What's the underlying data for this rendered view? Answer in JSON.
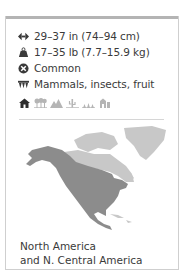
{
  "facts": {
    "length": {
      "icon": "length-arrows-icon",
      "text": "29–37 in (74–94 cm)"
    },
    "weight": {
      "icon": "weight-icon",
      "text": "17–35 lb (7.7–15.9 kg)"
    },
    "status": {
      "icon": "status-cross-icon",
      "text": "Common"
    },
    "diet": {
      "icon": "diet-teeth-icon",
      "text": "Mammals, insects, fruit"
    }
  },
  "habitats": [
    {
      "icon": "urban-icon",
      "active": true
    },
    {
      "icon": "forest-icon",
      "active": false
    },
    {
      "icon": "mountains-icon",
      "active": false
    },
    {
      "icon": "desert-icon",
      "active": false
    },
    {
      "icon": "grassland-icon",
      "active": false
    },
    {
      "icon": "farmland-icon",
      "active": false
    }
  ],
  "map": {
    "range_color": "#8c8c8c",
    "land_color": "#c8c8c8"
  },
  "caption": {
    "line1": "North America",
    "line2": "and N. Central America"
  }
}
